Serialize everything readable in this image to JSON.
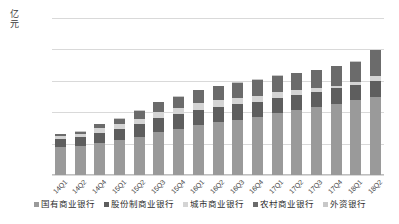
{
  "chart_data": {
    "type": "bar",
    "stacked": true,
    "title": "",
    "xlabel": "",
    "ylabel": "亿元",
    "ylim": [
      0,
      25000
    ],
    "ytick_labels": [
      "0",
      "5000",
      "10000",
      "15000",
      "20000",
      "25000"
    ],
    "ytick_values": [
      0,
      5000,
      10000,
      15000,
      20000,
      25000
    ],
    "grid": true,
    "legend_position": "bottom",
    "categories": [
      "14Q1",
      "14Q2",
      "14Q4",
      "15Q1",
      "15Q2",
      "15Q3",
      "15Q4",
      "16Q1",
      "16Q2",
      "16Q3",
      "16Q4",
      "17Q1",
      "17Q2",
      "17Q3",
      "17Q4",
      "18Q1",
      "18Q2"
    ],
    "series": [
      {
        "name": "国有商业银行",
        "color": "#9a9a9a",
        "values": [
          4400,
          4600,
          5100,
          5500,
          6000,
          6800,
          7300,
          7900,
          8400,
          8800,
          9200,
          9800,
          10300,
          10800,
          11300,
          11900,
          12400
        ]
      },
      {
        "name": "股份制商业银行",
        "color": "#5e5e5e",
        "values": [
          1350,
          1400,
          1650,
          1800,
          2050,
          2250,
          2400,
          2500,
          2500,
          2450,
          2450,
          2500,
          2500,
          2500,
          2500,
          2500,
          2500
        ]
      },
      {
        "name": "城市商业银行",
        "color": "#d4d4d4",
        "values": [
          450,
          520,
          700,
          800,
          900,
          950,
          1000,
          1050,
          1100,
          1050,
          1000,
          900,
          700,
          500,
          400,
          350,
          900
        ]
      },
      {
        "name": "农村商业银行",
        "color": "#6b6b6b",
        "values": [
          320,
          380,
          620,
          900,
          1250,
          1600,
          1750,
          2050,
          2150,
          2400,
          2500,
          2600,
          2700,
          2900,
          3100,
          3300,
          4100
        ]
      },
      {
        "name": "外资银行",
        "color": "#c8c8c8",
        "values": [
          80,
          80,
          80,
          80,
          80,
          80,
          80,
          80,
          80,
          80,
          80,
          80,
          80,
          80,
          80,
          80,
          80
        ]
      }
    ]
  },
  "axis": {
    "unit_chars": [
      "亿",
      "元"
    ]
  }
}
